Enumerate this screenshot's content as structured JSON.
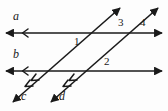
{
  "figure": {
    "width": 168,
    "height": 111,
    "background_color": "#fdfdfd",
    "stroke_color": "#1a1a1a"
  },
  "lines": [
    {
      "id": "a",
      "label": "a",
      "orientation": "horizontal",
      "description": "upper horizontal line with arrowheads at both ends and a single parallel tick chevron on the left",
      "x1": 4,
      "y1": 33,
      "x2": 164,
      "y2": 33,
      "tick_marks": 1
    },
    {
      "id": "b",
      "label": "b",
      "orientation": "horizontal",
      "description": "lower horizontal line with arrowheads at both ends and a single parallel tick chevron on the left",
      "x1": 4,
      "y1": 71,
      "x2": 164,
      "y2": 71,
      "tick_marks": 1
    },
    {
      "id": "c",
      "label": "c",
      "orientation": "diagonal",
      "description": "left transversal rising left-to-right with arrowheads at both ends and a double tick chevron near the lower end",
      "x1": 11,
      "y1": 104,
      "x2": 122,
      "y2": 6,
      "tick_marks": 2
    },
    {
      "id": "d",
      "label": "d",
      "orientation": "diagonal",
      "description": "right transversal rising left-to-right, parallel to c, with arrowheads at both ends and a double tick chevron near the lower end",
      "x1": 49,
      "y1": 104,
      "x2": 160,
      "y2": 6,
      "tick_marks": 2
    }
  ],
  "angle_labels": [
    {
      "id": "1",
      "text": "1",
      "x": 74,
      "y": 37,
      "at_intersection": "a-and-c"
    },
    {
      "id": "2",
      "text": "2",
      "x": 104,
      "y": 57,
      "at_intersection": "b-and-d"
    },
    {
      "id": "3",
      "text": "3",
      "x": 118,
      "y": 19,
      "at_intersection": "a-and-d"
    },
    {
      "id": "4",
      "text": "4",
      "x": 139,
      "y": 19,
      "at_intersection": "a-and-d"
    }
  ],
  "line_labels": [
    {
      "id": "a",
      "text": "a",
      "x": 13,
      "y": 16
    },
    {
      "id": "b",
      "text": "b",
      "x": 13,
      "y": 54
    },
    {
      "id": "c",
      "text": "c",
      "x": 20,
      "y": 95
    },
    {
      "id": "d",
      "text": "d",
      "x": 58,
      "y": 95
    }
  ]
}
